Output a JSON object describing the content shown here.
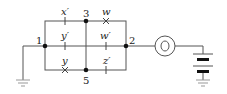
{
  "diagram": {
    "type": "circuit",
    "nodes": [
      {
        "id": "1",
        "label": "1"
      },
      {
        "id": "2",
        "label": "2"
      },
      {
        "id": "3",
        "label": "3"
      },
      {
        "id": "5",
        "label": "5"
      }
    ],
    "switches": [
      {
        "label": "x′",
        "state": "closed",
        "position": "top-left"
      },
      {
        "label": "w",
        "state": "open",
        "position": "top-right"
      },
      {
        "label": "y′",
        "state": "closed",
        "position": "middle-left"
      },
      {
        "label": "w′",
        "state": "closed",
        "position": "middle-right"
      },
      {
        "label": "y",
        "state": "open",
        "position": "bottom-left"
      },
      {
        "label": "z′",
        "state": "closed",
        "position": "bottom-right"
      }
    ],
    "components": {
      "lamp": "lamp-icon",
      "battery": "battery-icon",
      "ground_left": "ground-icon",
      "ground_right": "ground-icon"
    },
    "colors": {
      "wire": "#555555",
      "node": "#111111"
    }
  }
}
